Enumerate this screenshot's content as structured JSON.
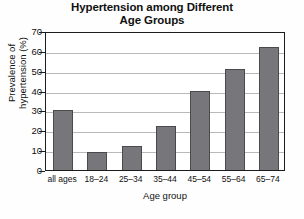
{
  "chart_data": {
    "type": "bar",
    "title": "Hypertension among Different Age Groups",
    "title_lines": [
      "Hypertension among Different",
      "Age Groups"
    ],
    "xlabel": "Age group",
    "ylabel": "Prevalence of hypertension (%)",
    "ylabel_lines": [
      "Prevalence of",
      "hypertension (%)"
    ],
    "categories": [
      "all ages",
      "18–24",
      "25–34",
      "35–44",
      "45–54",
      "55–64",
      "65–74"
    ],
    "values": [
      30,
      9,
      12,
      22,
      40,
      51,
      62
    ],
    "ylim": [
      0,
      70
    ],
    "yticks": [
      0,
      10,
      20,
      30,
      40,
      50,
      60,
      70
    ],
    "ytick_labels": [
      "0",
      "10",
      "20",
      "30",
      "40",
      "50",
      "60",
      "70"
    ],
    "grid": true,
    "grid_axis": "y",
    "legend": false,
    "bar_color": "#77767a",
    "bar_edge_color": "#4a4a4c",
    "grid_color": "#b9b9b9",
    "axis_color": "#1c1c1c",
    "background_color": "#fefefe"
  }
}
